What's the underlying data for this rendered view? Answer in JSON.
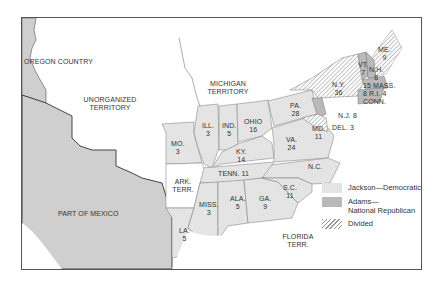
{
  "colors": {
    "jackson": "#e4e4e4",
    "adams": "#b9b9b9",
    "mexico_oregon": "#cfcfcf",
    "border": "#555555"
  },
  "regions": {
    "oregon": "OREGON COUNTRY",
    "unorganized": "UNORGANIZED TERRITORY",
    "michigan": "MICHIGAN TERRITORY",
    "mexico": "PART OF MEXICO",
    "florida": "FLORIDA TERR.",
    "arkansas": "ARK. TERR."
  },
  "states": [
    {
      "abbr": "MO.",
      "votes": "3"
    },
    {
      "abbr": "ILL.",
      "votes": "3"
    },
    {
      "abbr": "IND.",
      "votes": "5"
    },
    {
      "abbr": "OHIO",
      "votes": "16"
    },
    {
      "abbr": "KY.",
      "votes": "14"
    },
    {
      "abbr": "PA.",
      "votes": "28"
    },
    {
      "abbr": "VA.",
      "votes": "24"
    },
    {
      "abbr": "N.C.",
      "votes": ""
    },
    {
      "abbr": "TENN.",
      "votes": "11"
    },
    {
      "abbr": "S.C.",
      "votes": "11"
    },
    {
      "abbr": "GA.",
      "votes": "9"
    },
    {
      "abbr": "ALA.",
      "votes": "5"
    },
    {
      "abbr": "MISS.",
      "votes": "3"
    },
    {
      "abbr": "LA.",
      "votes": "5"
    },
    {
      "abbr": "N.Y.",
      "votes": "36"
    },
    {
      "abbr": "VT.",
      "votes": "7"
    },
    {
      "abbr": "N.H.",
      "votes": "8"
    },
    {
      "abbr": "ME.",
      "votes": "9"
    },
    {
      "abbr": "MASS.",
      "votes": "15"
    },
    {
      "abbr": "R.I.",
      "votes": "4"
    },
    {
      "abbr": "CONN.",
      "votes": "8"
    },
    {
      "abbr": "N.J.",
      "votes": "8"
    },
    {
      "abbr": "DEL.",
      "votes": "3"
    },
    {
      "abbr": "MD.",
      "votes": "11"
    }
  ],
  "legend": {
    "jackson": "Jackson—Democratic",
    "adams_1": "Adams—",
    "adams_2": "National Republican",
    "divided": "Divided"
  }
}
